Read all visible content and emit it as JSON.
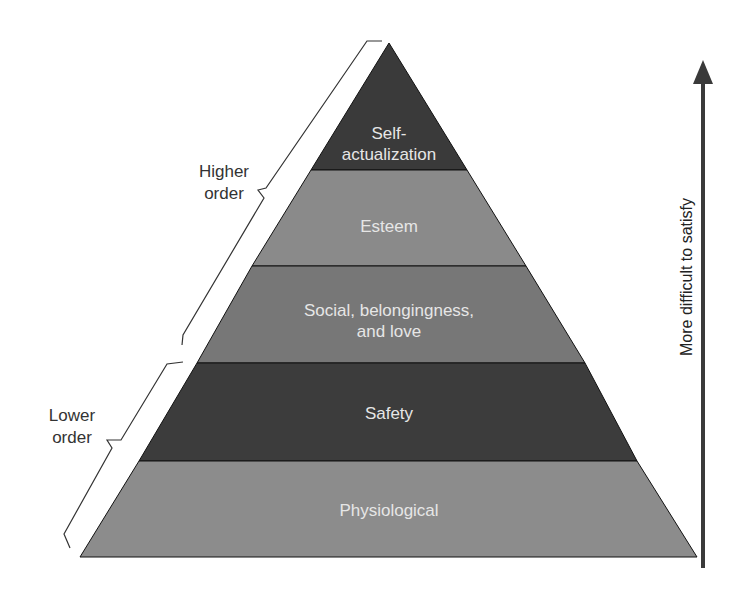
{
  "diagram": {
    "type": "pyramid",
    "layers": [
      {
        "name": "self-actualization",
        "label_line1": "Self-",
        "label_line2": "actualization",
        "color": "#3a3a3a"
      },
      {
        "name": "esteem",
        "label_line1": "Esteem",
        "color": "#8a8a8a"
      },
      {
        "name": "social",
        "label_line1": "Social, belongingness,",
        "label_line2": "and love",
        "color": "#777777"
      },
      {
        "name": "safety",
        "label_line1": "Safety",
        "color": "#3c3c3c"
      },
      {
        "name": "physiological",
        "label_line1": "Physiological",
        "color": "#8c8c8c"
      }
    ],
    "brackets": {
      "higher": {
        "line1": "Higher",
        "line2": "order"
      },
      "lower": {
        "line1": "Lower",
        "line2": "order"
      }
    },
    "arrow": {
      "label": "More difficult to satisfy",
      "color": "#3a3a3a"
    }
  }
}
